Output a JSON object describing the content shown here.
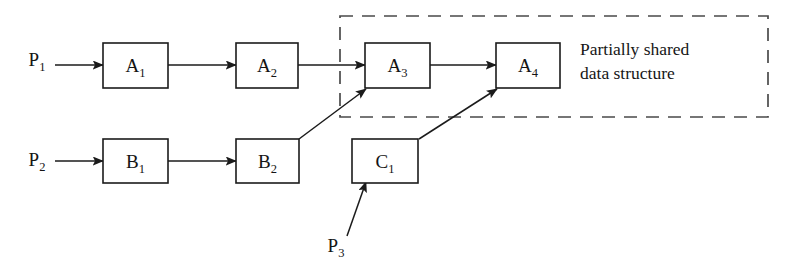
{
  "diagram": {
    "background_color": "#ffffff",
    "stroke_color": "#1b1b1b",
    "dashed_color": "#4a4a4a",
    "nodes": [
      {
        "id": "A1",
        "base": "A",
        "sub": "1",
        "x": 103,
        "y": 43,
        "w": 65,
        "h": 45
      },
      {
        "id": "A2",
        "base": "A",
        "sub": "2",
        "x": 236,
        "y": 43,
        "w": 62,
        "h": 45
      },
      {
        "id": "A3",
        "base": "A",
        "sub": "3",
        "x": 365,
        "y": 43,
        "w": 65,
        "h": 45
      },
      {
        "id": "A4",
        "base": "A",
        "sub": "4",
        "x": 496,
        "y": 43,
        "w": 64,
        "h": 45
      },
      {
        "id": "B1",
        "base": "B",
        "sub": "1",
        "x": 103,
        "y": 139,
        "w": 65,
        "h": 44
      },
      {
        "id": "B2",
        "base": "B",
        "sub": "2",
        "x": 236,
        "y": 139,
        "w": 63,
        "h": 44
      },
      {
        "id": "C1",
        "base": "C",
        "sub": "1",
        "x": 352,
        "y": 139,
        "w": 66,
        "h": 44
      }
    ],
    "process_labels": [
      {
        "id": "P1",
        "base": "P",
        "sub": "1",
        "x": 37,
        "y": 66
      },
      {
        "id": "P2",
        "base": "P",
        "sub": "2",
        "x": 37,
        "y": 166
      },
      {
        "id": "P3",
        "base": "P",
        "sub": "3",
        "x": 336,
        "y": 252
      }
    ],
    "edges": [
      {
        "id": "P1-A1",
        "from": "P1",
        "to": "A1",
        "x1": 55,
        "y1": 65,
        "x2": 103,
        "y2": 65
      },
      {
        "id": "A1-A2",
        "from": "A1",
        "to": "A2",
        "x1": 168,
        "y1": 65,
        "x2": 236,
        "y2": 65
      },
      {
        "id": "A2-A3",
        "from": "A2",
        "to": "A3",
        "x1": 298,
        "y1": 65,
        "x2": 365,
        "y2": 65
      },
      {
        "id": "A3-A4",
        "from": "A3",
        "to": "A4",
        "x1": 430,
        "y1": 65,
        "x2": 496,
        "y2": 65
      },
      {
        "id": "P2-B1",
        "from": "P2",
        "to": "B1",
        "x1": 55,
        "y1": 161,
        "x2": 103,
        "y2": 161
      },
      {
        "id": "B1-B2",
        "from": "B1",
        "to": "B2",
        "x1": 168,
        "y1": 161,
        "x2": 236,
        "y2": 161
      },
      {
        "id": "B2-A3",
        "from": "B2",
        "to": "A3",
        "x1": 299,
        "y1": 139,
        "x2": 366,
        "y2": 89
      },
      {
        "id": "C1-A4",
        "from": "C1",
        "to": "A4",
        "x1": 419,
        "y1": 139,
        "x2": 497,
        "y2": 89
      },
      {
        "id": "P3-C1",
        "from": "P3",
        "to": "C1",
        "x1": 347,
        "y1": 236,
        "x2": 366,
        "y2": 182
      }
    ],
    "group": {
      "id": "shared-structure-group",
      "x": 340,
      "y": 16,
      "w": 428,
      "h": 101,
      "caption_line1": "Partially shared",
      "caption_line2": "data structure",
      "caption_x": 580,
      "caption_line1_y": 55,
      "caption_line2_y": 79
    }
  }
}
